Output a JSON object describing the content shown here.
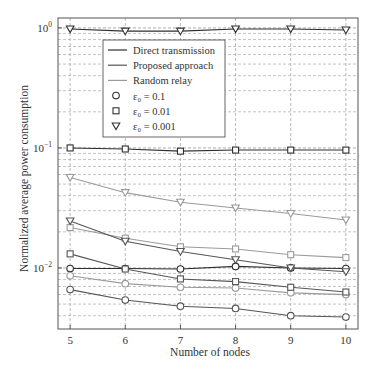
{
  "chart_data": {
    "type": "line",
    "title": "",
    "xlabel": "Number of nodes",
    "ylabel": "Normalized average power consumption",
    "yscale": "log",
    "x": [
      5,
      6,
      7,
      8,
      9,
      10
    ],
    "xticks": [
      "5",
      "6",
      "7",
      "8",
      "9",
      "10"
    ],
    "yticks": [
      {
        "value": 1,
        "base": "10",
        "exp": "0"
      },
      {
        "value": 0.1,
        "base": "10",
        "exp": "−1"
      },
      {
        "value": 0.01,
        "base": "10",
        "exp": "−2"
      }
    ],
    "xlim": [
      4.78,
      10.22
    ],
    "ylim": [
      0.0031,
      1.21
    ],
    "grid": true,
    "legend_position": "upper left (inset)",
    "legend": [
      {
        "label": "Direct transmission",
        "kind": "line",
        "color": "#2e2e2e"
      },
      {
        "label": "Proposed approach",
        "kind": "line",
        "color": "#555555"
      },
      {
        "label": "Random relay",
        "kind": "line",
        "color": "#9a9a9a"
      },
      {
        "label": "ε₀ = 0.1",
        "kind": "marker",
        "marker": "circle"
      },
      {
        "label": "ε₀ = 0.01",
        "kind": "marker",
        "marker": "square"
      },
      {
        "label": "ε₀ = 0.001",
        "kind": "marker",
        "marker": "triangle-down"
      }
    ],
    "series": [
      {
        "name": "Direct transmission, ε0 = 0.001",
        "method": "Direct transmission",
        "epsilon": 0.001,
        "marker": "triangle-down",
        "color": "#2e2e2e",
        "values": [
          0.98,
          0.94,
          0.94,
          0.98,
          0.98,
          0.96
        ]
      },
      {
        "name": "Direct transmission, ε0 = 0.01",
        "method": "Direct transmission",
        "epsilon": 0.01,
        "marker": "square",
        "color": "#2e2e2e",
        "values": [
          0.1,
          0.098,
          0.094,
          0.096,
          0.096,
          0.096
        ]
      },
      {
        "name": "Direct transmission, ε0 = 0.1",
        "method": "Direct transmission",
        "epsilon": 0.1,
        "marker": "circle",
        "color": "#2e2e2e",
        "values": [
          0.0099,
          0.0099,
          0.0098,
          0.0103,
          0.01,
          0.0099
        ]
      },
      {
        "name": "Random relay, ε0 = 0.001",
        "method": "Random relay",
        "epsilon": 0.001,
        "marker": "triangle-down",
        "color": "#9a9a9a",
        "values": [
          0.0568,
          0.0424,
          0.0353,
          0.0316,
          0.0284,
          0.0251
        ]
      },
      {
        "name": "Random relay, ε0 = 0.01",
        "method": "Random relay",
        "epsilon": 0.01,
        "marker": "square",
        "color": "#9a9a9a",
        "values": [
          0.0217,
          0.0177,
          0.015,
          0.0144,
          0.0129,
          0.0122
        ]
      },
      {
        "name": "Random relay, ε0 = 0.1",
        "method": "Random relay",
        "epsilon": 0.1,
        "marker": "circle",
        "color": "#9a9a9a",
        "values": [
          0.0086,
          0.0074,
          0.0069,
          0.0068,
          0.0062,
          0.006
        ]
      },
      {
        "name": "Proposed approach, ε0 = 0.001",
        "method": "Proposed approach",
        "epsilon": 0.001,
        "marker": "triangle-down",
        "color": "#555555",
        "values": [
          0.0246,
          0.0167,
          0.0137,
          0.0117,
          0.01,
          0.0093
        ]
      },
      {
        "name": "Proposed approach, ε0 = 0.01",
        "method": "Proposed approach",
        "epsilon": 0.01,
        "marker": "square",
        "color": "#555555",
        "values": [
          0.0131,
          0.0098,
          0.0081,
          0.0077,
          0.0069,
          0.0063
        ]
      },
      {
        "name": "Proposed approach, ε0 = 0.1",
        "method": "Proposed approach",
        "epsilon": 0.1,
        "marker": "circle",
        "color": "#555555",
        "values": [
          0.0066,
          0.0054,
          0.0048,
          0.0046,
          0.004,
          0.0039
        ]
      }
    ]
  }
}
